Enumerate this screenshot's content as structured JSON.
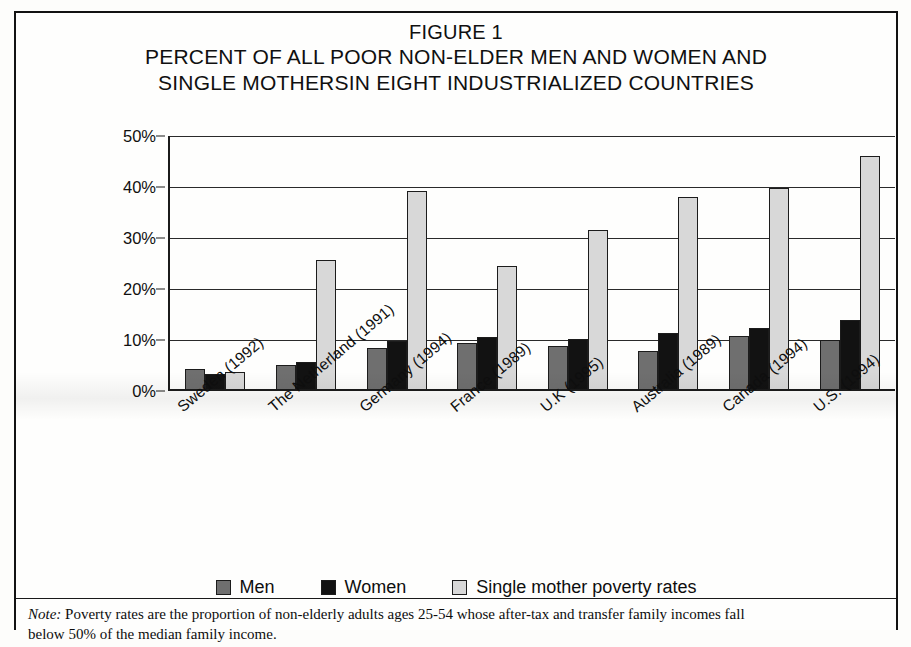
{
  "figure": {
    "label": "FIGURE 1",
    "title_line1": "PERCENT OF ALL POOR NON-ELDER MEN AND WOMEN AND",
    "title_line2": "SINGLE MOTHERSIN EIGHT INDUSTRIALIZED COUNTRIES"
  },
  "legend": {
    "items": [
      {
        "label": "Men",
        "color": "#6f6f6f"
      },
      {
        "label": "Women",
        "color": "#121212"
      },
      {
        "label": "Single mother poverty rates",
        "color": "#d8d8d8"
      }
    ]
  },
  "footnote": {
    "lead": "Note:",
    "text": " Poverty rates are the proportion of non-elderly adults ages 25-54 whose after-tax and transfer family incomes fall",
    "line2": "below 50% of the median family income."
  },
  "chart_data": {
    "type": "bar",
    "title": "PERCENT OF ALL POOR NON-ELDER MEN AND WOMEN AND SINGLE MOTHERSIN EIGHT INDUSTRIALIZED COUNTRIES",
    "xlabel": "",
    "ylabel": "Percent poor",
    "ylim": [
      0,
      50
    ],
    "ytick_labels": [
      "0%",
      "10%",
      "20%",
      "30%",
      "40%",
      "50%"
    ],
    "ytick_values": [
      0,
      10,
      20,
      30,
      40,
      50
    ],
    "grid": true,
    "legend_position": "bottom",
    "categories": [
      "Sweden (1992)",
      "The Netherland (1991)",
      "Germany (1994)",
      "France (1989)",
      "U.K (1995)",
      "Australia (1989)",
      "Canada (1994)",
      "U.S. (1994)"
    ],
    "series": [
      {
        "name": "Men",
        "color": "#6f6f6f",
        "values": [
          4.0,
          4.8,
          8.0,
          9.0,
          8.4,
          7.5,
          10.4,
          9.7
        ]
      },
      {
        "name": "Women",
        "color": "#121212",
        "values": [
          3.0,
          5.3,
          9.5,
          10.2,
          9.8,
          11.0,
          12.0,
          13.6
        ]
      },
      {
        "name": "Single mother poverty rates",
        "color": "#d8d8d8",
        "values": [
          3.3,
          25.3,
          38.8,
          24.1,
          31.2,
          37.6,
          39.4,
          45.6
        ]
      }
    ]
  }
}
